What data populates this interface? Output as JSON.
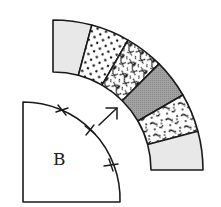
{
  "diagram": {
    "title": "",
    "template_label": "B",
    "arc_strip": {
      "center": [
        53,
        170
      ],
      "outer_radius": 150,
      "inner_radius": 98,
      "segments": [
        {
          "pattern": "solid-light-gray",
          "fill": "#e8e8e8"
        },
        {
          "pattern": "polka-dots",
          "fill": "#ffffff"
        },
        {
          "pattern": "floral-print",
          "fill": "#ffffff"
        },
        {
          "pattern": "solid-dark-gray",
          "fill": "#9a9a9a"
        },
        {
          "pattern": "speckled-print",
          "fill": "#ffffff"
        },
        {
          "pattern": "solid-light-gray",
          "fill": "#e8e8e8"
        }
      ]
    },
    "quarter_circle": {
      "label": "B",
      "corner": [
        23,
        202
      ],
      "radius": 97,
      "match_marks": 3
    },
    "arrow": {
      "direction": "up-right",
      "meaning": "placement direction"
    },
    "colors": {
      "stroke": "#1a1a1a",
      "light_gray": "#e8e8e8",
      "dark_gray": "#9a9a9a"
    }
  }
}
